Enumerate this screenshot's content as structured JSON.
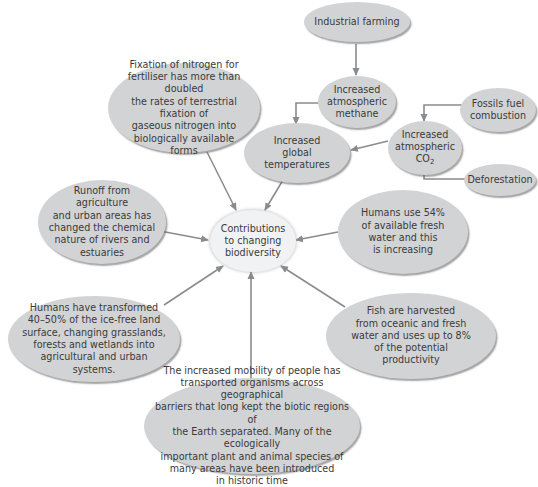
{
  "diagram": {
    "center": {
      "label": "Contributions\nto changing\nbiodiversity"
    },
    "nodes": {
      "industrial_farming": "Industrial farming",
      "methane": "Increased\natmospheric\nmethane",
      "fossil_fuel": "Fossils fuel\ncombustion",
      "co2_prefix": "Increased\natmospheric\nCO",
      "co2_subscript": "2",
      "deforestation": "Deforestation",
      "global_temperatures": "Increased\nglobal\ntemperatures",
      "nitrogen_fixation": "Fixation of nitrogen for\nfertiliser has more than doubled\nthe rates of terrestrial fixation of\ngaseous nitrogen into\nbiologically available\nforms",
      "runoff": "Runoff from agriculture\nand urban areas has\nchanged the chemical\nnature of rivers and\nestuaries",
      "fresh_water": "Humans use 54%\nof available fresh\nwater and this\nis increasing",
      "land_transformed": "Humans have transformed\n40–50% of the ice-free land\nsurface, changing grasslands,\nforests and wetlands into\nagricultural and urban\nsystems.",
      "fish_harvest": "Fish are harvested\nfrom oceanic and fresh\nwater and uses up to 8%\nof the potential\nproductivity",
      "mobility": "The increased mobility of people has\ntransported organisms across geographical\nbarriers that long kept the biotic regions of\nthe Earth separated. Many of the ecologically\nimportant plant and animal species of\nmany areas have been introduced\nin historic time"
    },
    "edges": [
      {
        "from": "industrial_farming",
        "to": "methane"
      },
      {
        "from": "methane",
        "to": "global_temperatures"
      },
      {
        "from": "fossil_fuel",
        "to": "co2"
      },
      {
        "from": "deforestation",
        "to": "co2"
      },
      {
        "from": "co2",
        "to": "global_temperatures"
      },
      {
        "from": "global_temperatures",
        "to": "center"
      },
      {
        "from": "nitrogen_fixation",
        "to": "center"
      },
      {
        "from": "runoff",
        "to": "center"
      },
      {
        "from": "fresh_water",
        "to": "center"
      },
      {
        "from": "land_transformed",
        "to": "center"
      },
      {
        "from": "mobility",
        "to": "center"
      },
      {
        "from": "fish_harvest",
        "to": "center"
      }
    ],
    "colors": {
      "node_fill": "#d2d3d5",
      "center_fill": "#f1f2f3",
      "arrow": "#8a8b8d",
      "text": "#3a3a3a"
    }
  }
}
